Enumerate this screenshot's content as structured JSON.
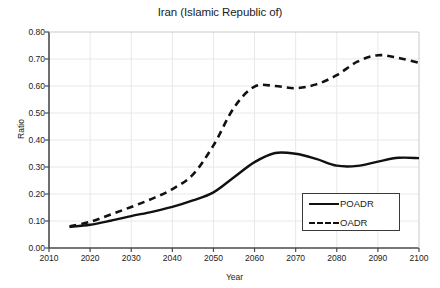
{
  "chart_data": {
    "type": "line",
    "title": "Iran (Islamic Republic of)",
    "xlabel": "Year",
    "ylabel": "Ratio",
    "xlim": [
      2010,
      2100
    ],
    "ylim": [
      0.0,
      0.8
    ],
    "xticks": [
      2010,
      2020,
      2030,
      2040,
      2050,
      2060,
      2070,
      2080,
      2090,
      2100
    ],
    "xtick_labels": [
      "2010",
      "2020",
      "2030",
      "2040",
      "2050",
      "2060",
      "2070",
      "2080",
      "2090",
      "2100"
    ],
    "yticks": [
      0.0,
      0.1,
      0.2,
      0.3,
      0.4,
      0.5,
      0.6,
      0.7,
      0.8
    ],
    "ytick_labels": [
      "0.00",
      "0.10",
      "0.20",
      "0.30",
      "0.40",
      "0.50",
      "0.60",
      "0.70",
      "0.80"
    ],
    "grid": true,
    "grid_color": "#e8e8e8",
    "axis_color": "#4a4a4a",
    "legend_position": "lower right",
    "x": [
      2015,
      2020,
      2025,
      2030,
      2035,
      2040,
      2045,
      2050,
      2055,
      2060,
      2065,
      2070,
      2075,
      2080,
      2085,
      2090,
      2095,
      2100
    ],
    "series": [
      {
        "name": "POADR",
        "style": "solid",
        "color": "#111111",
        "values": [
          0.078,
          0.086,
          0.101,
          0.118,
          0.134,
          0.152,
          0.176,
          0.206,
          0.262,
          0.318,
          0.352,
          0.349,
          0.33,
          0.305,
          0.304,
          0.32,
          0.334,
          0.333
        ]
      },
      {
        "name": "OADR",
        "style": "dashed",
        "color": "#111111",
        "values": [
          0.08,
          0.097,
          0.124,
          0.152,
          0.182,
          0.218,
          0.272,
          0.38,
          0.52,
          0.598,
          0.6,
          0.592,
          0.606,
          0.64,
          0.69,
          0.714,
          0.704,
          0.686
        ]
      }
    ]
  },
  "legend": {
    "entries": [
      {
        "label": "POADR",
        "style": "solid"
      },
      {
        "label": "OADR",
        "style": "dashed"
      }
    ]
  }
}
